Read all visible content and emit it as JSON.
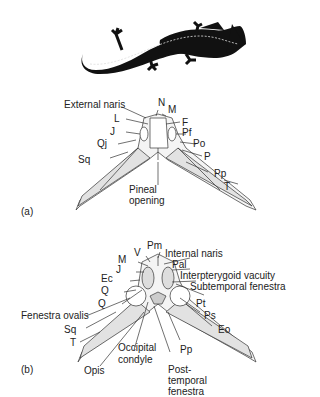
{
  "figure": {
    "silhouette": "salamander-like amphibian (dorsal view, black silhouette)",
    "panel_a": {
      "tag": "(a)",
      "view": "dorsal skull",
      "labels": {
        "external_naris": "External naris",
        "n": "N",
        "m": "M",
        "l": "L",
        "f": "F",
        "j": "J",
        "pf": "Pf",
        "qj": "Qj",
        "po": "Po",
        "p": "P",
        "sq": "Sq",
        "pp": "Pp",
        "t": "T",
        "pineal_1": "Pineal",
        "pineal_2": "opening"
      }
    },
    "panel_b": {
      "tag": "(b)",
      "view": "ventral skull",
      "labels": {
        "pm": "Pm",
        "v": "V",
        "m": "M",
        "internal_naris": "Internal naris",
        "j": "J",
        "pal": "Pal",
        "ec": "Ec",
        "interpterygoid": "Interpterygoid vacuity",
        "q1": "Q",
        "subtemporal": "Subtemporal fenestra",
        "q2": "Q",
        "pt": "Pt",
        "fenestra_ovalis": "Fenestra ovalis",
        "ps": "Ps",
        "sq": "Sq",
        "eo": "Eo",
        "t": "T",
        "occipital_1": "Occipital",
        "occipital_2": "condyle",
        "pp": "Pp",
        "opis": "Opis",
        "post_1": "Post-",
        "post_2": "temporal",
        "post_3": "fenestra"
      }
    }
  }
}
